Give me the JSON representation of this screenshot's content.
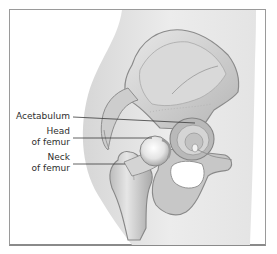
{
  "figure": {
    "labels": [
      {
        "id": "acetabulum",
        "line1": "Acetabulum",
        "line2": ""
      },
      {
        "id": "head-of-femur",
        "line1": "Head",
        "line2": "of femur"
      },
      {
        "id": "neck-of-femur",
        "line1": "Neck",
        "line2": "of femur"
      }
    ]
  },
  "colors": {
    "background": "#ffffff",
    "frame_border": "#9a9a9a",
    "body_silhouette": "#e2e2e2",
    "bone_light": "#dcdcdc",
    "bone_mid": "#bdbdbd",
    "bone_dark": "#8c8c8c",
    "leader_line": "#3a3a3a",
    "label_text": "#2e2e2e"
  }
}
